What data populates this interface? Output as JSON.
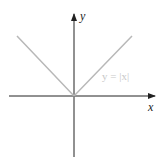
{
  "diagram": {
    "title": "",
    "function_label": "y = |x|",
    "x_axis_label": "x",
    "y_axis_label": "y",
    "colors": {
      "axis": "#222222",
      "graph": "#b8b8b8",
      "label": "#c8c8c8"
    }
  }
}
